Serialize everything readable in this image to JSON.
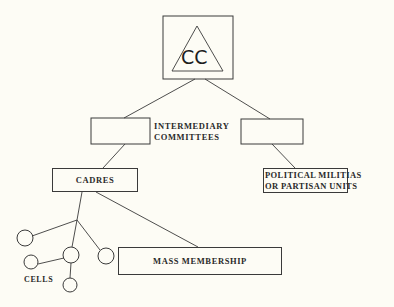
{
  "diagram": {
    "top_node": {
      "label": "CC",
      "shape": "triangle-in-square"
    },
    "intermediary": {
      "label_line1": "INTERMEDIARY",
      "label_line2": "COMMITTEES",
      "boxes": [
        "left-empty-box",
        "right-empty-box"
      ]
    },
    "cadres": {
      "label": "CADRES"
    },
    "militias": {
      "label_line1": "POLITICAL MILITIAS",
      "label_line2": "OR PARTISAN UNITS"
    },
    "mass_membership": {
      "label": "MASS MEMBERSHIP"
    },
    "cells": {
      "label": "CELLS",
      "count": 5
    },
    "colors": {
      "background": "#fdfcf5",
      "stroke": "#3a3a3a",
      "text": "#2a2a2a"
    }
  }
}
